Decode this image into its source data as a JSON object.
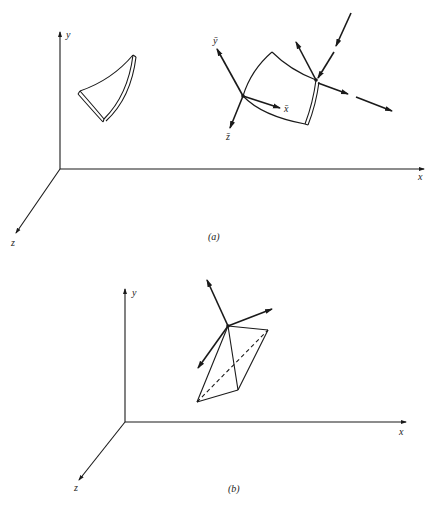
{
  "figure": {
    "panels": [
      {
        "id": "a",
        "caption": "(a)",
        "axes": {
          "x_label": "x",
          "y_label": "y",
          "z_label": "z"
        },
        "element_labels": {
          "x_bar": "x̄",
          "y_bar": "ȳ",
          "z_bar": "z̄"
        },
        "description": "Curved shell element in global axes, and element with local axes x̄, ȳ, z̄ and force vectors at a node"
      },
      {
        "id": "b",
        "caption": "(b)",
        "axes": {
          "x_label": "x",
          "y_label": "y",
          "z_label": "z"
        },
        "description": "Tetrahedral element with three vectors at a vertex"
      }
    ]
  }
}
